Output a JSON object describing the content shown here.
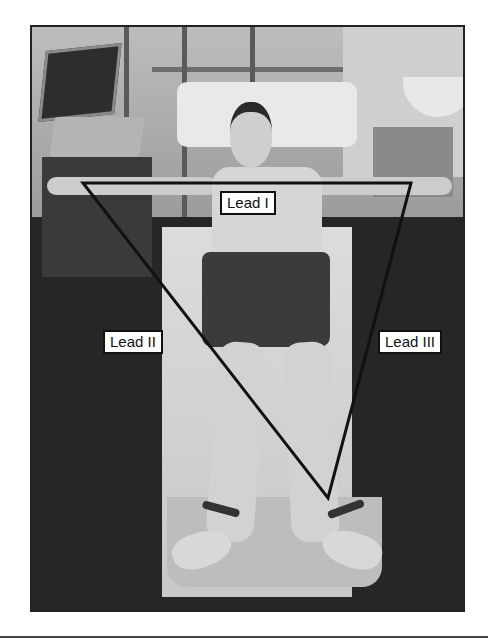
{
  "figure": {
    "labels": {
      "lead_1": "Lead I",
      "lead_2": "Lead II",
      "lead_3": "Lead III"
    },
    "triangle": {
      "vertices": {
        "right_arm": [
          83,
          183
        ],
        "left_arm": [
          411,
          183
        ],
        "left_leg": [
          328,
          498
        ]
      },
      "stroke_color": "#111111",
      "stroke_width": 3
    },
    "colors": {
      "background": "#ffffff",
      "frame_border": "#222222",
      "label_background": "#ffffff",
      "label_text": "#111111"
    }
  }
}
